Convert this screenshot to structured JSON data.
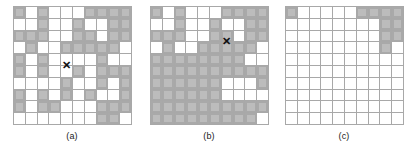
{
  "figure": {
    "grid_size": {
      "rows": 10,
      "cols": 10
    },
    "colors": {
      "grid_line": "#a8a8a8",
      "cell_fill_outer": "#a9a9a9",
      "cell_fill_inner": "#bcbcbc",
      "background": "#ffffff",
      "marker": "#111111",
      "caption_text": "#1a1a1a"
    },
    "marker_glyph": "✕"
  },
  "panels": [
    {
      "id": "panel-a",
      "caption": "(a)",
      "marker": {
        "row": 6,
        "col": 5,
        "label": "X"
      },
      "filled_cells": [
        [
          1,
          1
        ],
        [
          1,
          3
        ],
        [
          1,
          7
        ],
        [
          1,
          8
        ],
        [
          1,
          9
        ],
        [
          1,
          10
        ],
        [
          2,
          3
        ],
        [
          2,
          6
        ],
        [
          2,
          9
        ],
        [
          2,
          10
        ],
        [
          3,
          1
        ],
        [
          3,
          2
        ],
        [
          3,
          3
        ],
        [
          3,
          6
        ],
        [
          3,
          7
        ],
        [
          3,
          9
        ],
        [
          3,
          10
        ],
        [
          4,
          2
        ],
        [
          4,
          5
        ],
        [
          4,
          6
        ],
        [
          4,
          7
        ],
        [
          4,
          8
        ],
        [
          4,
          9
        ],
        [
          5,
          1
        ],
        [
          5,
          3
        ],
        [
          5,
          8
        ],
        [
          6,
          1
        ],
        [
          6,
          3
        ],
        [
          6,
          6
        ],
        [
          6,
          8
        ],
        [
          6,
          9
        ],
        [
          6,
          10
        ],
        [
          7,
          5
        ],
        [
          7,
          8
        ],
        [
          7,
          10
        ],
        [
          8,
          1
        ],
        [
          8,
          3
        ],
        [
          8,
          5
        ],
        [
          8,
          7
        ],
        [
          8,
          10
        ],
        [
          9,
          1
        ],
        [
          9,
          3
        ],
        [
          9,
          4
        ],
        [
          9,
          8
        ],
        [
          9,
          9
        ],
        [
          9,
          10
        ],
        [
          10,
          8
        ],
        [
          10,
          9
        ]
      ]
    },
    {
      "id": "panel-b",
      "caption": "(b)",
      "marker": {
        "row": 4,
        "col": 7,
        "label": "X"
      },
      "filled_cells": [
        [
          1,
          1
        ],
        [
          1,
          3
        ],
        [
          1,
          7
        ],
        [
          1,
          8
        ],
        [
          1,
          9
        ],
        [
          1,
          10
        ],
        [
          2,
          3
        ],
        [
          2,
          6
        ],
        [
          2,
          9
        ],
        [
          2,
          10
        ],
        [
          3,
          1
        ],
        [
          3,
          2
        ],
        [
          3,
          3
        ],
        [
          3,
          6
        ],
        [
          3,
          7
        ],
        [
          3,
          9
        ],
        [
          3,
          10
        ],
        [
          4,
          2
        ],
        [
          4,
          5
        ],
        [
          4,
          6
        ],
        [
          4,
          7
        ],
        [
          4,
          8
        ],
        [
          4,
          9
        ],
        [
          5,
          1
        ],
        [
          5,
          2
        ],
        [
          5,
          3
        ],
        [
          5,
          4
        ],
        [
          5,
          5
        ],
        [
          5,
          6
        ],
        [
          5,
          7
        ],
        [
          5,
          8
        ],
        [
          6,
          1
        ],
        [
          6,
          2
        ],
        [
          6,
          3
        ],
        [
          6,
          4
        ],
        [
          6,
          5
        ],
        [
          6,
          6
        ],
        [
          6,
          7
        ],
        [
          6,
          8
        ],
        [
          6,
          9
        ],
        [
          6,
          10
        ],
        [
          7,
          1
        ],
        [
          7,
          2
        ],
        [
          7,
          3
        ],
        [
          7,
          4
        ],
        [
          7,
          5
        ],
        [
          7,
          6
        ],
        [
          7,
          10
        ],
        [
          8,
          1
        ],
        [
          8,
          2
        ],
        [
          8,
          3
        ],
        [
          8,
          4
        ],
        [
          8,
          5
        ],
        [
          8,
          6
        ],
        [
          9,
          1
        ],
        [
          9,
          2
        ],
        [
          9,
          3
        ],
        [
          9,
          4
        ],
        [
          9,
          5
        ],
        [
          9,
          6
        ],
        [
          9,
          7
        ],
        [
          9,
          8
        ],
        [
          9,
          9
        ],
        [
          9,
          10
        ],
        [
          10,
          1
        ],
        [
          10,
          2
        ],
        [
          10,
          3
        ],
        [
          10,
          4
        ],
        [
          10,
          5
        ],
        [
          10,
          6
        ],
        [
          10,
          7
        ],
        [
          10,
          8
        ],
        [
          10,
          9
        ]
      ]
    },
    {
      "id": "panel-c",
      "caption": "(c)",
      "marker": null,
      "filled_cells": [
        [
          1,
          1
        ],
        [
          1,
          7
        ],
        [
          1,
          8
        ],
        [
          1,
          9
        ],
        [
          1,
          10
        ],
        [
          2,
          9
        ],
        [
          2,
          10
        ],
        [
          3,
          9
        ],
        [
          3,
          10
        ],
        [
          4,
          9
        ]
      ]
    }
  ]
}
